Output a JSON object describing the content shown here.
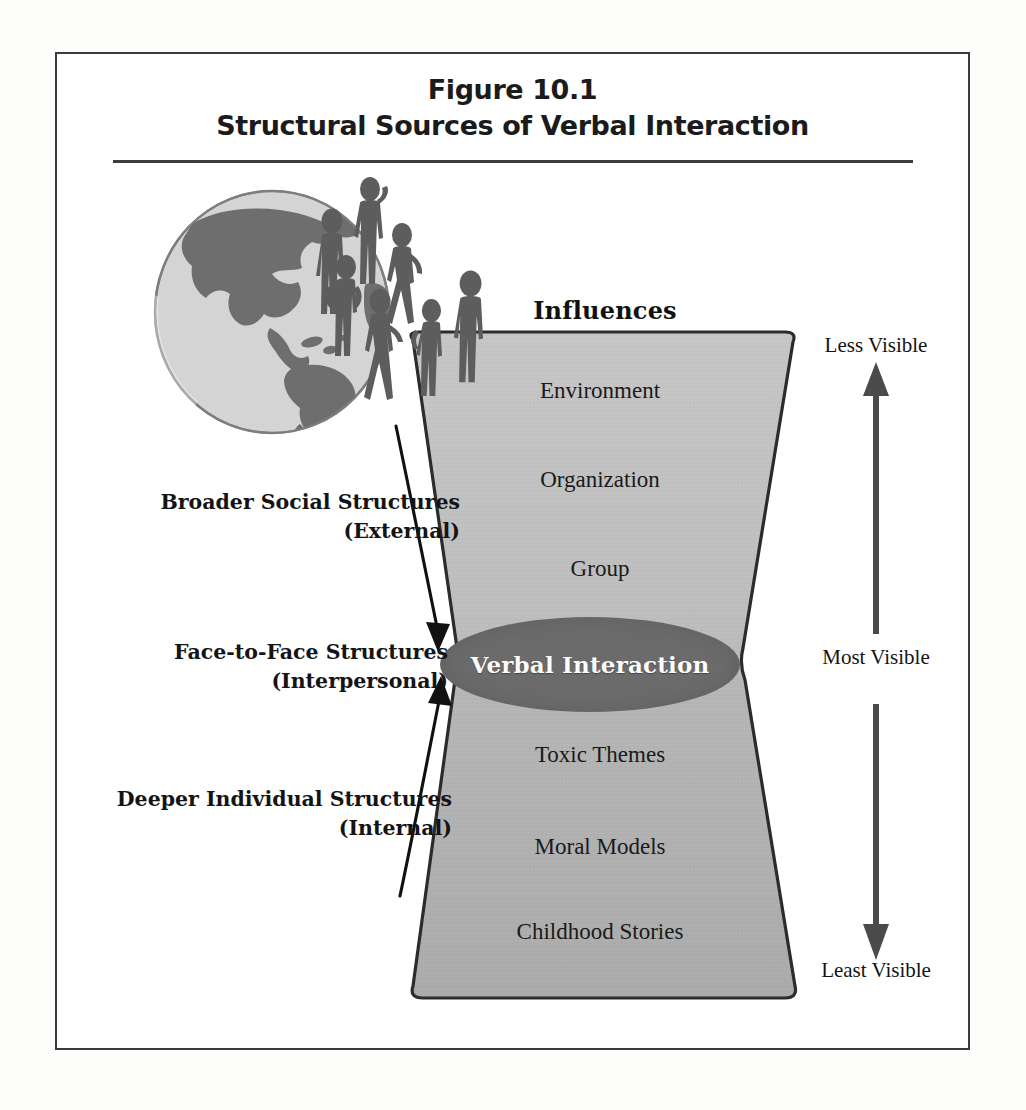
{
  "figure": {
    "number_line": "Figure 10.1",
    "title_line": "Structural Sources of Verbal Interaction"
  },
  "influences": {
    "heading": "Influences",
    "layers": [
      {
        "label": "Environment",
        "x": 600,
        "y": 392
      },
      {
        "label": "Organization",
        "x": 600,
        "y": 481
      },
      {
        "label": "Group",
        "x": 600,
        "y": 570
      },
      {
        "label": "Toxic Themes",
        "x": 600,
        "y": 756
      },
      {
        "label": "Moral Models",
        "x": 600,
        "y": 848
      },
      {
        "label": "Childhood Stories",
        "x": 600,
        "y": 933
      }
    ],
    "core": "Verbal Interaction"
  },
  "structures": [
    {
      "name": "Broader Social Structures",
      "qualifier": "(External)",
      "top": 488,
      "right": 460
    },
    {
      "name": "Face-to-Face Structures",
      "qualifier": "(Interpersonal)",
      "top": 638,
      "right": 448
    },
    {
      "name": "Deeper Individual Structures",
      "qualifier": "(Internal)",
      "top": 785,
      "right": 452
    }
  ],
  "visibility": {
    "top": "Less Visible",
    "middle": "Most Visible",
    "bottom": "Least Visible"
  },
  "icons": {
    "globe": "globe-americas-icon",
    "crowd": "people-crowd-icon",
    "down_arrow": "arrow-down-curved-icon",
    "up_arrow": "arrow-up-curved-icon",
    "vis_arrow": "double-headed-vertical-arrow-icon"
  },
  "colors": {
    "frame_stroke": "#3b3b3b",
    "funnel_fill_light": "#c2c2c2",
    "funnel_fill_dark": "#a9a9a9",
    "funnel_stroke": "#2a2a2a",
    "ellipse_fill": "#6b6b6b",
    "ellipse_text": "#fbfbfb",
    "globe_ocean": "#d2d2d2",
    "globe_land": "#6e6e6e",
    "person_fill": "#5f5f5f",
    "text": "#141414"
  }
}
